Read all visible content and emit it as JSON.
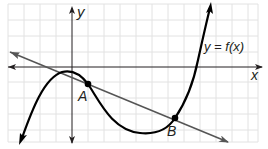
{
  "figure": {
    "type": "function-graph",
    "labels": {
      "x_axis": "x",
      "y_axis": "y",
      "curve": "y = f(x)",
      "point_a": "A",
      "point_b": "B"
    },
    "elements": [
      {
        "name": "curve",
        "description": "cubic-like curve y = f(x) with local max left of y-axis and local min below x-axis"
      },
      {
        "name": "secant-line",
        "description": "straight line through points A and B, decreasing"
      },
      {
        "name": "point-A",
        "description": "intersection of line and curve just right of y-axis"
      },
      {
        "name": "point-B",
        "description": "intersection of line and curve on rising branch"
      }
    ],
    "colors": {
      "grid": "#e2e2e2",
      "axis": "#231f20",
      "curve": "#000000",
      "line": "#555555"
    }
  }
}
